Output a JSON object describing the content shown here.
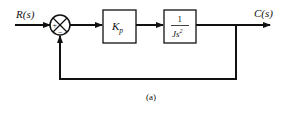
{
  "diagram": {
    "type": "block-diagram",
    "caption": "(a)",
    "input": {
      "label": "R(s)"
    },
    "output": {
      "label": "C(s)"
    },
    "summing_junction": {
      "signs": {
        "left": "+",
        "bottom": "−"
      }
    },
    "blocks": [
      {
        "id": "controller",
        "label_main": "K",
        "label_sub": "p"
      },
      {
        "id": "plant",
        "numerator": "1",
        "denominator": "Js",
        "denominator_exp": "2"
      }
    ],
    "feedback": "unity"
  },
  "colors": {
    "stroke": "#111111",
    "background": "#ffffff"
  }
}
